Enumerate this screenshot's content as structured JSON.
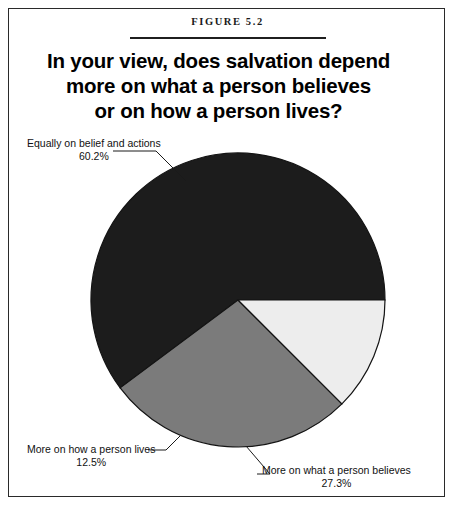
{
  "figure": {
    "label": "FIGURE 5.2",
    "title_lines": [
      "In your view, does salvation depend",
      "more on what a person believes",
      "or on how a person lives?"
    ]
  },
  "callouts": {
    "equally": {
      "label": "Equally on belief and actions",
      "percent": "60.2%"
    },
    "lives": {
      "label": "More on how a person lives",
      "percent": "12.5%"
    },
    "believes": {
      "label": "More on what a person believes",
      "percent": "27.3%"
    }
  },
  "chart_data": {
    "type": "pie",
    "title": "In your view, does salvation depend more on what a person believes or on how a person lives?",
    "categories": [
      "Equally on belief and actions",
      "More on what a person believes",
      "More on how a person lives"
    ],
    "values": [
      60.2,
      27.3,
      12.5
    ],
    "labels": [
      "60.2%",
      "27.3%",
      "12.5%"
    ],
    "colors": [
      "#1c1c1c",
      "#7b7b7b",
      "#ededed"
    ],
    "units": "percent",
    "start_angle_deg": 0,
    "direction": "counterclockwise",
    "legend": "callout-labels",
    "grid": false,
    "center": {
      "x": 238,
      "y": 300
    },
    "radius": 147,
    "stroke_color": "#141414"
  }
}
